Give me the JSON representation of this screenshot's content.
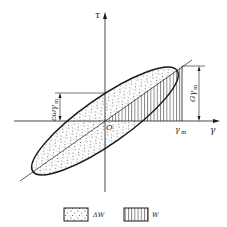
{
  "diagram": {
    "type": "hysteresis-loop",
    "axes": {
      "vertical_label": "τ",
      "horizontal_label": "γ",
      "origin_label": "O"
    },
    "annotations": {
      "gamma_m": "γ",
      "gamma_m_sub": "m",
      "G_gamma_m": "Gγ",
      "G_gamma_m_sub": "m",
      "c_omega_gamma_m": "cωγ",
      "c_omega_gamma_m_sub": "m"
    },
    "legend": [
      {
        "symbol": "dotted-box",
        "label": "ΔW"
      },
      {
        "symbol": "hatched-box",
        "label": "W"
      }
    ],
    "colors": {
      "line": "#1a1a1a",
      "background": "#ffffff"
    }
  }
}
